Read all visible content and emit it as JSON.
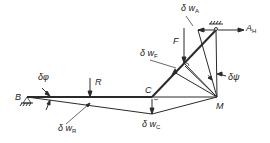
{
  "figure": {
    "type": "structural virtual-displacement diagram",
    "labels": {
      "B": "B",
      "C": "C",
      "M": "M",
      "R": "R",
      "F": "F",
      "A_H": {
        "main": "A",
        "sub": "H"
      },
      "dphi": "δφ",
      "dpsi": "δψ",
      "dw_R": {
        "main": "δ w",
        "sub": "R"
      },
      "dw_C": {
        "main": "δ w",
        "sub": "C"
      },
      "dw_F": {
        "main": "δ w",
        "sub": "F"
      },
      "dw_A": {
        "main": "δ w",
        "sub": "A"
      }
    },
    "colors": {
      "line": "#2a2a2a",
      "background": "#ffffff"
    }
  }
}
